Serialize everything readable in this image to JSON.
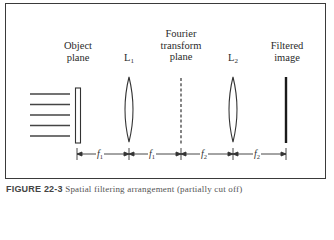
{
  "figure": {
    "labels": {
      "object_plane": [
        "Object",
        "plane"
      ],
      "lens1": {
        "main": "L",
        "sub": "1"
      },
      "fourier_plane": [
        "Fourier",
        "transform",
        "plane"
      ],
      "lens2": {
        "main": "L",
        "sub": "2"
      },
      "filtered_image": [
        "Filtered",
        "image"
      ]
    },
    "dimensions": [
      {
        "main": "f",
        "sub": "1"
      },
      {
        "main": "f",
        "sub": "1"
      },
      {
        "main": "f",
        "sub": "2"
      },
      {
        "main": "f",
        "sub": "2"
      }
    ],
    "incoming_ray_count": 5,
    "caption": {
      "figure_id": "FIGURE 22-3",
      "text": "Spatial filtering arrangement (partially cut off)"
    },
    "colors": {
      "frame": "#3a3a3a",
      "lines": "#333333",
      "background": "#ffffff"
    }
  }
}
